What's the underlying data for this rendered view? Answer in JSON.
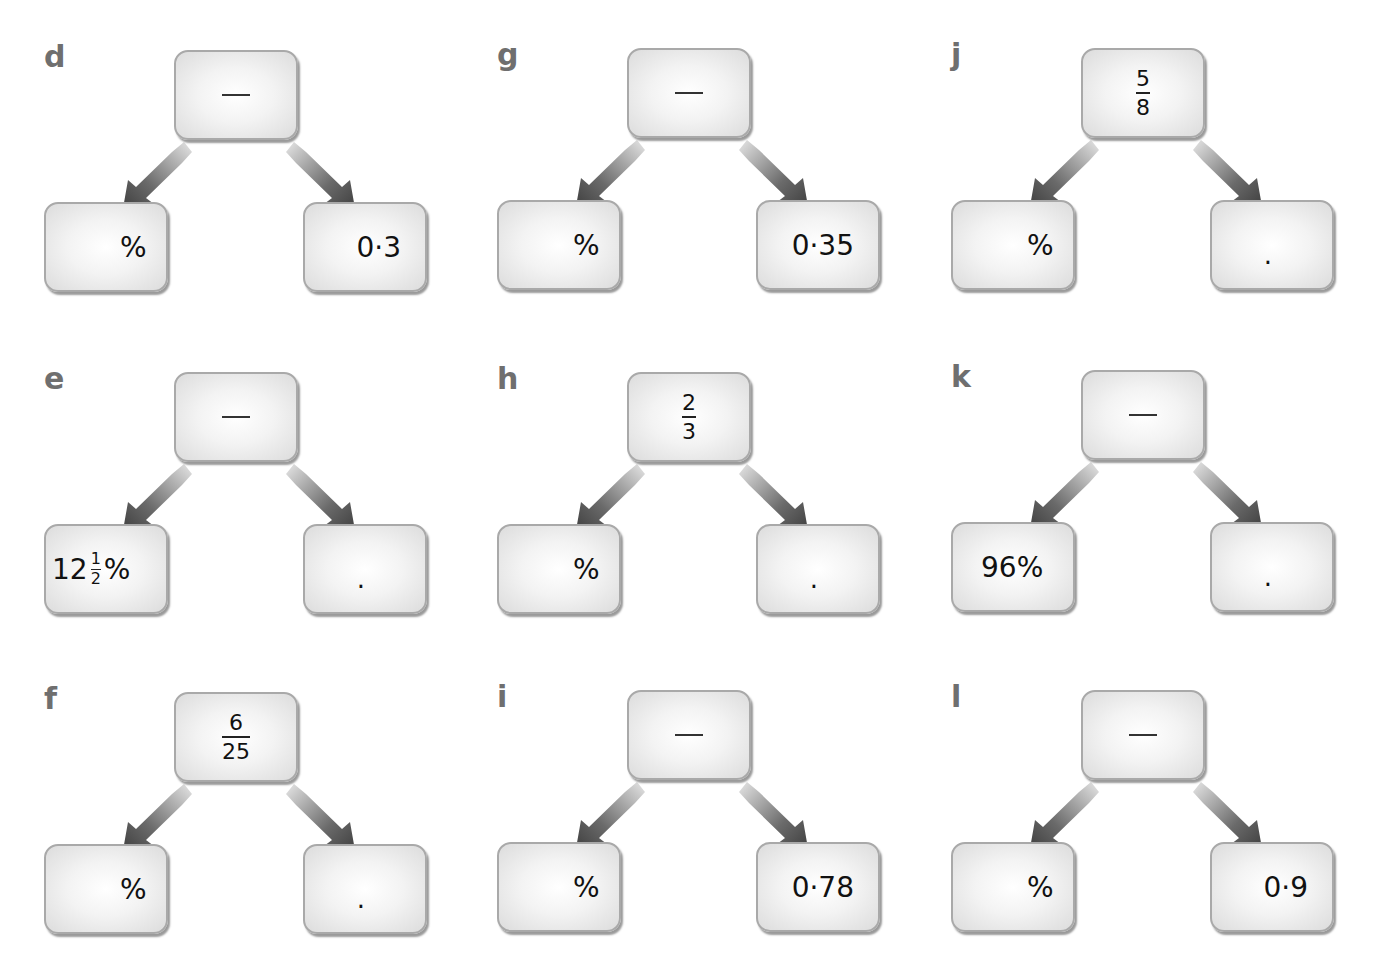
{
  "problems": [
    {
      "letter": "d",
      "top": {
        "type": "blank"
      },
      "left": {
        "type": "pct_blank",
        "text": "%"
      },
      "right": {
        "type": "decimal",
        "text": "0·3"
      }
    },
    {
      "letter": "e",
      "top": {
        "type": "blank"
      },
      "left": {
        "type": "mixed_pct",
        "whole": "12",
        "num": "1",
        "den": "2",
        "suffix": "%"
      },
      "right": {
        "type": "dot_blank",
        "text": "."
      }
    },
    {
      "letter": "f",
      "top": {
        "type": "fraction",
        "num": "6",
        "den": "25"
      },
      "left": {
        "type": "pct_blank",
        "text": "%"
      },
      "right": {
        "type": "dot_blank",
        "text": "."
      }
    },
    {
      "letter": "g",
      "top": {
        "type": "blank"
      },
      "left": {
        "type": "pct_blank",
        "text": "%"
      },
      "right": {
        "type": "decimal",
        "text": "0·35"
      }
    },
    {
      "letter": "h",
      "top": {
        "type": "fraction",
        "num": "2",
        "den": "3"
      },
      "left": {
        "type": "pct_blank",
        "text": "%"
      },
      "right": {
        "type": "dot_blank",
        "text": "."
      }
    },
    {
      "letter": "i",
      "top": {
        "type": "blank"
      },
      "left": {
        "type": "pct_blank",
        "text": "%"
      },
      "right": {
        "type": "decimal",
        "text": "0·78"
      }
    },
    {
      "letter": "j",
      "top": {
        "type": "fraction",
        "num": "5",
        "den": "8"
      },
      "left": {
        "type": "pct_blank",
        "text": "%"
      },
      "right": {
        "type": "dot_blank",
        "text": "."
      }
    },
    {
      "letter": "k",
      "top": {
        "type": "blank"
      },
      "left": {
        "type": "pct_value",
        "text": "96%"
      },
      "right": {
        "type": "dot_blank",
        "text": "."
      }
    },
    {
      "letter": "l",
      "top": {
        "type": "blank"
      },
      "left": {
        "type": "pct_blank",
        "text": "%"
      },
      "right": {
        "type": "decimal",
        "text": "0·9"
      }
    }
  ],
  "colors": {
    "letter": "#6f6f6f",
    "box_border": "#a9a9a9",
    "arrow": "#3a3a3a"
  }
}
